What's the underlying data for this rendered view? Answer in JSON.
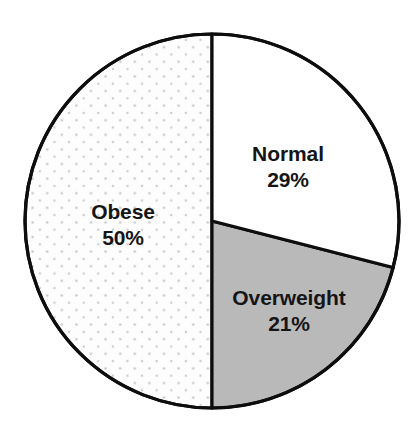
{
  "chart_data": {
    "type": "pie",
    "title": "",
    "subtitle": "",
    "xlabel": "",
    "ylabel": "",
    "legend_position": "none",
    "grid": false,
    "unit": "%",
    "total": 100,
    "categories": [
      "Normal",
      "Overweight",
      "Obese"
    ],
    "values": [
      29,
      21,
      50
    ],
    "start_angle_deg": 0,
    "direction": "clockwise",
    "slices": [
      {
        "label": "Normal",
        "value": 29,
        "value_text": "29%",
        "fill": "#ffffff",
        "pattern": "solid",
        "stroke": "#111111",
        "start_angle_deg": 0,
        "end_angle_deg": 104.4
      },
      {
        "label": "Overweight",
        "value": 21,
        "value_text": "21%",
        "fill": "#b9b9b9",
        "pattern": "solid",
        "stroke": "#111111",
        "start_angle_deg": 104.4,
        "end_angle_deg": 180
      },
      {
        "label": "Obese",
        "value": 50,
        "value_text": "50%",
        "fill": "#fdfdfd",
        "pattern": "dotted-stipple",
        "stroke": "#111111",
        "start_angle_deg": 180,
        "end_angle_deg": 360
      }
    ],
    "geometry": {
      "center_x": 212,
      "center_y": 221,
      "radius": 187
    },
    "colors": {
      "outline": "#111111",
      "background": "#ffffff",
      "gray_fill": "#b9b9b9",
      "stipple_dot": "#c9c9c9",
      "label_text": "#151515"
    }
  }
}
